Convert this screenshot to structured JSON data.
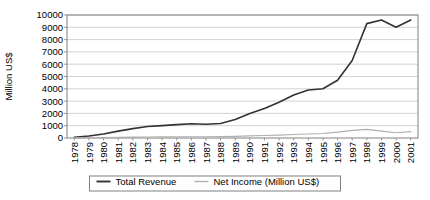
{
  "chart_data": {
    "type": "line",
    "title": "",
    "xlabel": "",
    "ylabel": "Million US$",
    "ylim": [
      0,
      10000
    ],
    "ytick_step": 1000,
    "grid": true,
    "legend_position": "bottom",
    "categories": [
      "1978",
      "1979",
      "1980",
      "1981",
      "1982",
      "1983",
      "1984",
      "1985",
      "1986",
      "1987",
      "1988",
      "1989",
      "1990",
      "1991",
      "1992",
      "1993",
      "1994",
      "1995",
      "1996",
      "1997",
      "1998",
      "1999",
      "2000",
      "2001"
    ],
    "yticks": [
      "0",
      "1000",
      "2000",
      "3000",
      "4000",
      "5000",
      "6000",
      "7000",
      "8000",
      "9000",
      "10000"
    ],
    "series": [
      {
        "name": "Total Revenue",
        "color": "#333333",
        "width": 1.6,
        "values": [
          60,
          160,
          330,
          560,
          760,
          930,
          1010,
          1090,
          1160,
          1120,
          1180,
          1500,
          2000,
          2400,
          2900,
          3500,
          3900,
          4000,
          4700,
          6300,
          9300,
          9600,
          9000,
          9600
        ]
      },
      {
        "name": "Net Income (Million US$)",
        "color": "#b0b0b0",
        "width": 1.1,
        "values": [
          10,
          20,
          35,
          50,
          70,
          85,
          95,
          100,
          105,
          100,
          110,
          130,
          170,
          200,
          230,
          280,
          330,
          360,
          480,
          620,
          700,
          560,
          430,
          520
        ]
      }
    ]
  },
  "plot": {
    "left": 67,
    "right": 418,
    "top": 15,
    "bottom": 138,
    "border_color": "#808080",
    "grid_color": "#c8c8c8",
    "legend_box_color": "#808080"
  }
}
